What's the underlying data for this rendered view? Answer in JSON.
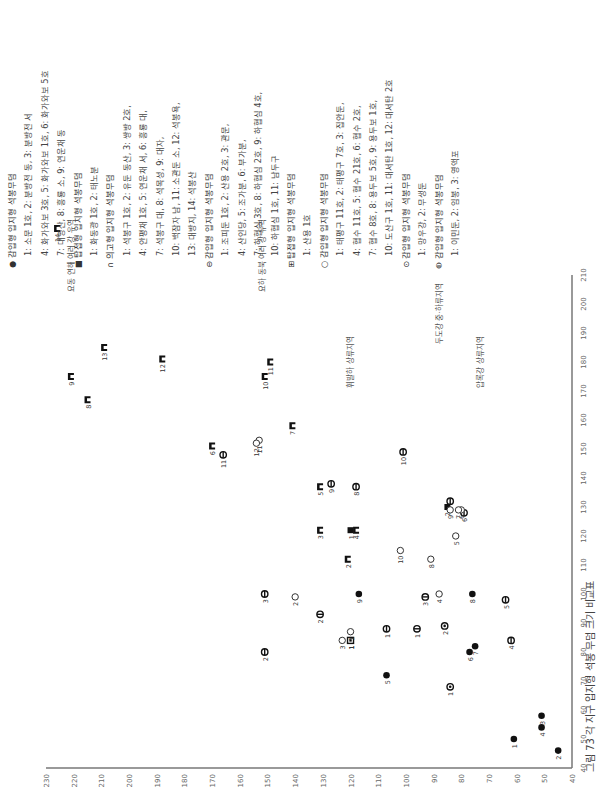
{
  "caption": "그림 73  각 지구 입지형 석봉 무덤 크기 비교표",
  "legend": [
    {
      "symbol": "filled-circle",
      "heading": "감입형 입지형 석봉무덤",
      "lines": [
        "1: 소문 1호, 2: 분방전 동, 3: 분방전 서",
        "4: 화가와보 3호, 5: 화가와보 1호, 6: 화가와보 5호",
        "7: 대영산, 8: 흥룡 소, 9: 연운채 동"
      ]
    },
    {
      "symbol": "filled-square",
      "heading": "탑접형 입지형 석봉무덤",
      "lines": [
        "1: 화동광 1호, 2: 태노분"
      ]
    },
    {
      "symbol": "n-block",
      "heading": "의고형 입지형 석봉무덤",
      "lines": [
        "1: 석봉구 1호, 2: 유둔 동산, 3: 쌍방 2호,",
        "4: 안평채 1호, 5: 연운채 서,  6: 흥룡 대,",
        "7: 석봉구 대, 8: 석목성, 9: 대자,",
        "10: 백잠자 남, 11: 소관둔 소,  12: 석봉욕,",
        "13: 대방지, 14: 석봉산"
      ]
    },
    {
      "symbol": "circle-bar",
      "heading": "감입형 입지형 석봉무덤",
      "lines": [
        "1: 조피둔 1호, 2: 산용 2호, 3: 관문,",
        "4: 산인당, 5: 조가분, 6: 부가분,",
        "7: 하협심 3호,  8: 하협심 2호, 9: 하협심 4호,",
        "10: 하협심 1호, 11: 남두구"
      ]
    },
    {
      "symbol": "grid-square",
      "heading": "탑접형 입지형 석봉무덤",
      "lines": [
        "1: 산용 1호"
      ]
    },
    {
      "symbol": "open-circle",
      "heading": "감입형 입지형 석봉무덤",
      "lines": [
        "1: 태평구 11호, 2: 태평구 7호, 3: 집안둔,",
        "4: 협수 11호, 5: 협수 21호, 6: 협수 2호,",
        "7: 협수 8호, 8: 용두보 5호, 9: 용두보 1호,",
        "10: 도산구 1호, 11: 대서탄 1호, 12: 대서탄 2호"
      ]
    },
    {
      "symbol": "circle-dot",
      "heading": "감입형 입지형 석봉무덤",
      "lines": [
        "1: 망우강, 2: 무생둔"
      ]
    },
    {
      "symbol": "circle-line",
      "heading": "감입형 입지형 석봉무덤",
      "lines": [
        "1: 이민둔, 2: 임봉, 3: 영액포"
      ]
    }
  ],
  "chart_data": {
    "type": "scatter",
    "title": "그림 73  각 지구 입지형 석봉 무덤 크기 비교표",
    "orientation": "rotated-90-ccw",
    "xlabel": "",
    "ylabel": "",
    "xlim": [
      40,
      210
    ],
    "ylim": [
      40,
      230
    ],
    "xticks": [
      40,
      50,
      60,
      70,
      80,
      90,
      100,
      110,
      120,
      130,
      140,
      150,
      160,
      170,
      180,
      190,
      200,
      210
    ],
    "yticks": [
      40,
      50,
      60,
      70,
      80,
      90,
      100,
      110,
      120,
      130,
      140,
      150,
      160,
      170,
      180,
      190,
      200,
      210,
      220,
      230
    ],
    "grid": false,
    "regions": [
      {
        "label": "요동 연해 여러 강 유역",
        "x": 218,
        "y": 220
      },
      {
        "label": "요하 동북 여러 강 유역",
        "x": 218,
        "y": 151
      },
      {
        "label": "휘발하 상류지역",
        "x": 185,
        "y": 119
      },
      {
        "label": "두도강 중·하류지역",
        "x": 200,
        "y": 87
      },
      {
        "label": "압록강 상류지역",
        "x": 185,
        "y": 72
      }
    ],
    "series": [
      {
        "name": "감입형(●)",
        "symbol": "filled-circle",
        "points": [
          {
            "id": "1",
            "x": 50,
            "y": 61
          },
          {
            "id": "2",
            "x": 46,
            "y": 45
          },
          {
            "id": "3",
            "x": 58,
            "y": 51
          },
          {
            "id": "4",
            "x": 54,
            "y": 51
          },
          {
            "id": "5",
            "x": 72,
            "y": 107
          },
          {
            "id": "6",
            "x": 80,
            "y": 77
          },
          {
            "id": "7",
            "x": 82,
            "y": 75
          },
          {
            "id": "8",
            "x": 100,
            "y": 76
          },
          {
            "id": "9",
            "x": 100,
            "y": 117
          }
        ]
      },
      {
        "name": "탑접형(■)",
        "symbol": "filled-square",
        "points": [
          {
            "id": "1",
            "x": 122,
            "y": 120
          },
          {
            "id": "2",
            "x": 130,
            "y": 85
          }
        ]
      },
      {
        "name": "의고형(n)",
        "symbol": "n-block",
        "points": [
          {
            "id": "1",
            "x": 84,
            "y": 120
          },
          {
            "id": "2",
            "x": 112,
            "y": 121
          },
          {
            "id": "3",
            "x": 122,
            "y": 131
          },
          {
            "id": "4",
            "x": 122,
            "y": 118
          },
          {
            "id": "5",
            "x": 137,
            "y": 131
          },
          {
            "id": "6",
            "x": 151,
            "y": 170
          },
          {
            "id": "7",
            "x": 158,
            "y": 141
          },
          {
            "id": "8",
            "x": 167,
            "y": 215
          },
          {
            "id": "9",
            "x": 175,
            "y": 221
          },
          {
            "id": "10",
            "x": 175,
            "y": 151
          },
          {
            "id": "11",
            "x": 180,
            "y": 149
          },
          {
            "id": "12",
            "x": 181,
            "y": 188
          },
          {
            "id": "13",
            "x": 185,
            "y": 209
          },
          {
            "id": "14",
            "x": 226,
            "y": 226
          }
        ]
      },
      {
        "name": "감입형(⊖)",
        "symbol": "circle-bar",
        "points": [
          {
            "id": "1",
            "x": 88,
            "y": 107
          },
          {
            "id": "2",
            "x": 80,
            "y": 151
          },
          {
            "id": "3",
            "x": 100,
            "y": 151
          },
          {
            "id": "4",
            "x": 84,
            "y": 62
          },
          {
            "id": "5",
            "x": 98,
            "y": 64
          },
          {
            "id": "6",
            "x": 128,
            "y": 79
          },
          {
            "id": "7",
            "x": 132,
            "y": 84
          },
          {
            "id": "8",
            "x": 137,
            "y": 118
          },
          {
            "id": "9",
            "x": 138,
            "y": 127
          },
          {
            "id": "10",
            "x": 149,
            "y": 101
          },
          {
            "id": "11",
            "x": 148,
            "y": 166
          }
        ]
      },
      {
        "name": "탑접형(⊞)",
        "symbol": "grid-square",
        "points": [
          {
            "id": "1",
            "x": 84,
            "y": 120
          }
        ]
      },
      {
        "name": "감입형(○)",
        "symbol": "open-circle",
        "points": [
          {
            "id": "1",
            "x": 87,
            "y": 120
          },
          {
            "id": "2",
            "x": 99,
            "y": 140
          },
          {
            "id": "3",
            "x": 84,
            "y": 123
          },
          {
            "id": "4",
            "x": 100,
            "y": 88
          },
          {
            "id": "5",
            "x": 120,
            "y": 82
          },
          {
            "id": "6",
            "x": 129,
            "y": 80
          },
          {
            "id": "7",
            "x": 129,
            "y": 81
          },
          {
            "id": "8",
            "x": 112,
            "y": 91
          },
          {
            "id": "9",
            "x": 129,
            "y": 84
          },
          {
            "id": "10",
            "x": 115,
            "y": 102
          },
          {
            "id": "11",
            "x": 153,
            "y": 153
          },
          {
            "id": "12",
            "x": 152,
            "y": 154
          }
        ]
      },
      {
        "name": "감입형(⊙)",
        "symbol": "circle-dot",
        "points": [
          {
            "id": "1",
            "x": 68,
            "y": 84
          },
          {
            "id": "2",
            "x": 89,
            "y": 86
          }
        ]
      },
      {
        "name": "감입형(⊖b)",
        "symbol": "circle-line",
        "points": [
          {
            "id": "1",
            "x": 88,
            "y": 96
          },
          {
            "id": "2",
            "x": 93,
            "y": 131
          },
          {
            "id": "3",
            "x": 99,
            "y": 93
          }
        ]
      }
    ]
  }
}
